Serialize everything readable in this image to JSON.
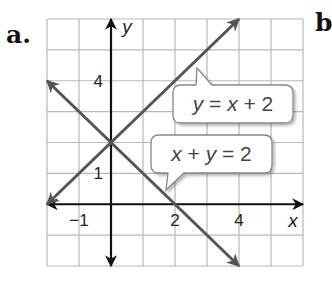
{
  "problem_label": "a.",
  "next_label": "b",
  "chart_data": {
    "type": "line",
    "title": "",
    "xlabel": "x",
    "ylabel": "y",
    "xlim": [
      -2,
      6
    ],
    "ylim": [
      -2,
      6
    ],
    "grid": true,
    "x_tick_labels": [
      {
        "value": -1,
        "label": "−1"
      },
      {
        "value": 2,
        "label": "2"
      },
      {
        "value": 4,
        "label": "4"
      }
    ],
    "y_tick_labels": [
      {
        "value": 1,
        "label": "1"
      },
      {
        "value": 4,
        "label": "4"
      }
    ],
    "series": [
      {
        "name": "y = x + 2",
        "equation": "y = x + 2",
        "x": [
          -2,
          4
        ],
        "y": [
          0,
          6
        ],
        "color": "#555555",
        "arrows": "both"
      },
      {
        "name": "x + y = 2",
        "equation": "x + y = 2",
        "x": [
          -2,
          4
        ],
        "y": [
          4,
          -2
        ],
        "color": "#555555",
        "arrows": "both"
      }
    ],
    "annotations": [
      {
        "text": "y = x + 2",
        "points_to": "line y = x + 2"
      },
      {
        "text": "x + y = 2",
        "points_to": "line x + y = 2"
      }
    ],
    "intersection": {
      "x": 0,
      "y": 2
    }
  },
  "colors": {
    "grid": "#b8b8b8",
    "axis": "#111111",
    "line": "#555555",
    "callout_border": "#888888"
  }
}
